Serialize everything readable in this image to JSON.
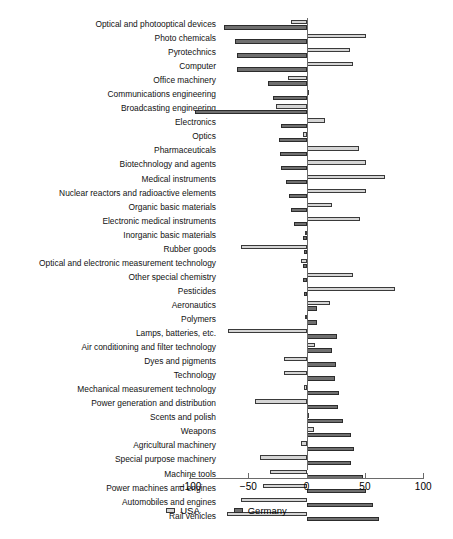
{
  "chart_data": {
    "type": "bar",
    "orientation": "horizontal",
    "title": "",
    "xlabel": "",
    "ylabel": "",
    "xlim": [
      -100,
      100
    ],
    "xticks": [
      -100,
      -50,
      0,
      50,
      100
    ],
    "xtick_labels": [
      "−100",
      "−50",
      "0",
      "50",
      "100"
    ],
    "grid": false,
    "legend_position": "bottom-center",
    "zero_line": true,
    "categories": [
      "Optical and photooptical devices",
      "Photo chemicals",
      "Pyrotechnics",
      "Computer",
      "Office machinery",
      "Communications engineering",
      "Broadcasting engineering",
      "Electronics",
      "Optics",
      "Pharmaceuticals",
      "Biotechnology and agents",
      "Medical instruments",
      "Nuclear reactors and radioactive elements",
      "Organic basic materials",
      "Electronic medical instruments",
      "Inorganic basic materials",
      "Rubber goods",
      "Optical and electronic measurement technology",
      "Other special chemistry",
      "Pesticides",
      "Aeronautics",
      "Polymers",
      "Lamps, batteries, etc.",
      "Air conditioning and filter technology",
      "Dyes and pigments",
      "Technology",
      "Mechanical measurement technology",
      "Power generation and distribution",
      "Scents and polish",
      "Weapons",
      "Agricultural machinery",
      "Special purpose machinery",
      "Machine tools",
      "Power machines and engines",
      "Automobiles and engines",
      "Rail vehicles"
    ],
    "series": [
      {
        "name": "USA",
        "color": "#d5d5d5",
        "values": [
          -13,
          51,
          37,
          40,
          -16,
          1,
          -26,
          16,
          -3,
          45,
          51,
          67,
          51,
          22,
          46,
          -1,
          -56,
          -5,
          40,
          76,
          20,
          -1,
          -67,
          7,
          -19,
          -19,
          -2,
          -44,
          0,
          6,
          -5,
          -40,
          -31,
          -37,
          -56,
          -68
        ]
      },
      {
        "name": "Germany",
        "color": "#6f6f6f",
        "values": [
          -71,
          -61,
          -60,
          -60,
          -33,
          -29,
          -96,
          -22,
          -24,
          -23,
          -22,
          -18,
          -15,
          -13,
          -11,
          -3,
          -2,
          -3,
          -3,
          -2,
          9,
          9,
          26,
          22,
          25,
          24,
          28,
          27,
          31,
          38,
          41,
          38,
          48,
          51,
          57,
          62
        ]
      }
    ]
  },
  "legend": {
    "items": [
      {
        "label": "USA",
        "swatch": "usa-swatch"
      },
      {
        "label": "Germany",
        "swatch": "germany-swatch"
      }
    ]
  }
}
